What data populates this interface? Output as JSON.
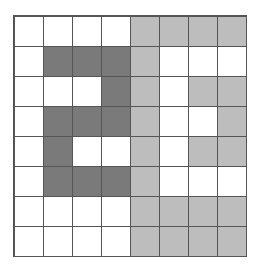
{
  "grid": {
    "rows": 8,
    "cols": 8,
    "colors": {
      "W": "#ffffff",
      "D": "#7a7a7a",
      "L": "#bdbdbd"
    },
    "cells": [
      [
        "W",
        "W",
        "W",
        "W",
        "L",
        "L",
        "L",
        "L"
      ],
      [
        "W",
        "D",
        "D",
        "D",
        "L",
        "W",
        "W",
        "W"
      ],
      [
        "W",
        "W",
        "W",
        "D",
        "L",
        "W",
        "L",
        "L"
      ],
      [
        "W",
        "D",
        "D",
        "D",
        "L",
        "W",
        "W",
        "L"
      ],
      [
        "W",
        "D",
        "W",
        "W",
        "L",
        "W",
        "L",
        "L"
      ],
      [
        "W",
        "D",
        "D",
        "D",
        "L",
        "W",
        "W",
        "W"
      ],
      [
        "W",
        "W",
        "W",
        "W",
        "L",
        "L",
        "L",
        "L"
      ],
      [
        "W",
        "W",
        "W",
        "W",
        "L",
        "L",
        "L",
        "L"
      ]
    ]
  }
}
